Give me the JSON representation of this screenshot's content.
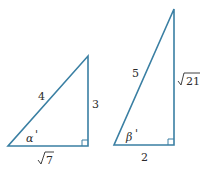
{
  "colors": {
    "stroke": "#3a7fa3",
    "text": "#2b2b2b"
  },
  "triangles": [
    {
      "name": "left-triangle",
      "hypotenuse": "4",
      "vertical_leg": "3",
      "horizontal_leg_radicand": "7",
      "angle": "α",
      "angle_mark": "'"
    },
    {
      "name": "right-triangle",
      "hypotenuse": "5",
      "vertical_leg_radicand": "21",
      "horizontal_leg": "2",
      "angle": "β",
      "angle_mark": "'"
    }
  ]
}
